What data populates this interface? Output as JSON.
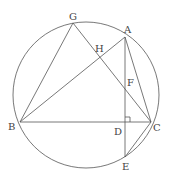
{
  "diagram": {
    "type": "geometry",
    "circle": {
      "cx": 86,
      "cy": 95,
      "r": 73
    },
    "points": {
      "A": {
        "x": 125,
        "y": 37,
        "lx": 124,
        "ly": 33
      },
      "B": {
        "x": 20,
        "y": 122,
        "lx": 8,
        "ly": 130
      },
      "C": {
        "x": 151,
        "y": 122,
        "lx": 153,
        "ly": 131
      },
      "D": {
        "x": 125,
        "y": 122,
        "lx": 114,
        "ly": 135
      },
      "E": {
        "x": 125,
        "y": 157,
        "lx": 122,
        "ly": 170
      },
      "F": {
        "x": 125,
        "y": 88,
        "lx": 127,
        "ly": 86
      },
      "G": {
        "x": 73,
        "y": 23,
        "lx": 69,
        "ly": 20
      },
      "H": {
        "x": 100,
        "y": 56,
        "lx": 95,
        "ly": 52
      }
    },
    "labels": {
      "A": "A",
      "B": "B",
      "C": "C",
      "D": "D",
      "E": "E",
      "F": "F",
      "G": "G",
      "H": "H"
    },
    "segments": [
      [
        "G",
        "B"
      ],
      [
        "G",
        "C"
      ],
      [
        "B",
        "A"
      ],
      [
        "B",
        "C"
      ],
      [
        "A",
        "C"
      ],
      [
        "A",
        "E"
      ],
      [
        "C",
        "E"
      ]
    ],
    "right_angle_at": "D"
  }
}
